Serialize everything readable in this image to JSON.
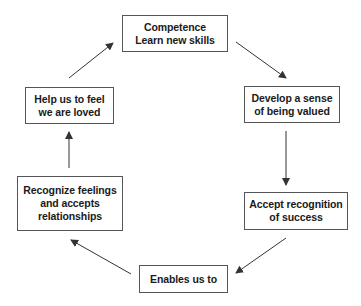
{
  "diagram": {
    "type": "cycle",
    "colors": {
      "background": "#ffffff",
      "box_border": "#555555",
      "arrow": "#333333",
      "text": "#1a1a1a"
    },
    "nodes": [
      {
        "id": "competence",
        "lines": [
          "Competence",
          "Learn new skills"
        ]
      },
      {
        "id": "valued",
        "lines": [
          "Develop a sense",
          "of being valued"
        ]
      },
      {
        "id": "recognition",
        "lines": [
          "Accept recognition",
          "of success"
        ]
      },
      {
        "id": "enables",
        "lines": [
          "Enables us to"
        ]
      },
      {
        "id": "feelings",
        "lines": [
          "Recognize feelings",
          "and accepts",
          "relationships"
        ]
      },
      {
        "id": "loved",
        "lines": [
          "Help us to feel",
          "we are loved"
        ]
      }
    ],
    "edges": [
      {
        "from": "competence",
        "to": "valued"
      },
      {
        "from": "valued",
        "to": "recognition"
      },
      {
        "from": "recognition",
        "to": "enables"
      },
      {
        "from": "enables",
        "to": "feelings"
      },
      {
        "from": "feelings",
        "to": "loved"
      },
      {
        "from": "loved",
        "to": "competence"
      }
    ]
  }
}
